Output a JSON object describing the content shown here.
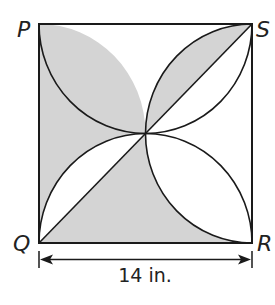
{
  "figure": {
    "shape": "square with four semicircular arcs forming a pinwheel",
    "vertices": {
      "top_left": "P",
      "top_right": "S",
      "bottom_left": "Q",
      "bottom_right": "R"
    },
    "dimension_label": "14 in.",
    "dimension_side": "QR",
    "shaded_regions": [
      "left region between side PQ and arcs through center",
      "half-lens between arc and diagonal toward S",
      "bottom region between side QR, arc to R, and diagonal QS"
    ],
    "colors": {
      "stroke": "#1a1a1a",
      "shade": "#d4d4d4",
      "background": "#ffffff"
    }
  }
}
